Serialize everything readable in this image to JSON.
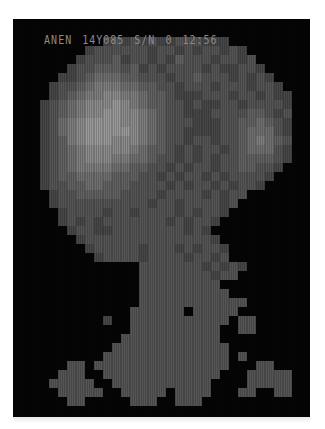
{
  "header": {
    "fields": [
      "ANEN",
      "14Y085",
      "S/N",
      "0",
      "12:56"
    ]
  },
  "panel": {
    "background": "#050505",
    "cell_px": 9,
    "cols": 33,
    "palette": [
      "#050505",
      "#2a2a2a",
      "#3a3a3a",
      "#474747",
      "#555555",
      "#626262",
      "#707070",
      "#7e7e7e",
      "#8c8c8c",
      "#9a9a9a"
    ]
  },
  "scan": {
    "rows": [
      "000000000000000000000000000000000",
      "000000000000000000000000000000000",
      "000000000034343433444333000000000",
      "000000003444444344343443430000000",
      "000000034445344343544434434000000",
      "000000344555453434444343344300000",
      "000003345666554443445444343430000",
      "000034456777665544344434443443000",
      "000034567788776554333444344343300",
      "000345678889876554434334434444300",
      "000345678899887654433344445543400",
      "000346789999887654443334455654300",
      "000346789999987654433334456664300",
      "000345789998887654434434456765400",
      "000345678888876554343443456664300",
      "000345678887766544343434455554300",
      "000345677776655443434434455443000",
      "000345566665554434344343444430000",
      "000344556655544443434434344300000",
      "000034455555444434444343440000000",
      "000034444444444344344443400000000",
      "000003444434434444343443000000000",
      "000003434344444443434430000000000",
      "000000344334444444434300000000000",
      "000000034444444444444430000000000",
      "000000003444443444343443000000000",
      "000000000344443444434434000000000",
      "000000000000004444444343430000000",
      "000000000000004444444434400000000",
      "000000000000004444444440000000000",
      "000000000000004444444444000000000",
      "000000000000004444444444440000000",
      "000000000000044444404444400000000",
      "000000000030044444444444044000000",
      "000000000000044444444440044000000",
      "000000000000444444444440000000000",
      "000000000004444444444444000000000",
      "000000000044444444444444040000000",
      "000000440444444444444444000440000",
      "000004440044444444444440004444400",
      "000044444004444444444400004444400",
      "000004444400444440444400044004400",
      "000000440000044400444000000000000",
      "000000000000000000000000000000000",
      "000000000000000000000000000000000"
    ]
  }
}
